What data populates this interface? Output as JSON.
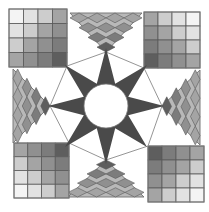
{
  "colors": {
    "background": "#ffffff",
    "star": "#4a4a4a",
    "center": "#ffffff",
    "outline": "#7a7a7a",
    "grid_line": "#5a5a5a",
    "shades": [
      "#f4f4f4",
      "#e2e2e2",
      "#cdcdcd",
      "#b8b8b8",
      "#a4a4a4",
      "#909090",
      "#7c7c7c",
      "#5e5e5e"
    ]
  },
  "corner_squares": [
    {
      "name": "top-left",
      "x": 9,
      "y": 9,
      "size": 58,
      "dark_corner": "bottom-right"
    },
    {
      "name": "top-right",
      "x": 144,
      "y": 12,
      "size": 56,
      "dark_corner": "bottom-left"
    },
    {
      "name": "bottom-left",
      "x": 14,
      "y": 143,
      "size": 55,
      "dark_corner": "top-right"
    },
    {
      "name": "bottom-right",
      "x": 148,
      "y": 146,
      "size": 56,
      "dark_corner": "top-left"
    }
  ],
  "edge_triangles": [
    {
      "name": "top",
      "base": [
        [
          70,
          13
        ],
        [
          142,
          13
        ]
      ],
      "apex": [
        106,
        52
      ]
    },
    {
      "name": "bottom",
      "base": [
        [
          68,
          197
        ],
        [
          144,
          197
        ]
      ],
      "apex": [
        106,
        160
      ]
    },
    {
      "name": "left",
      "base": [
        [
          13,
          69
        ],
        [
          13,
          143
        ]
      ],
      "apex": [
        50,
        106
      ]
    },
    {
      "name": "right",
      "base": [
        [
          200,
          70
        ],
        [
          200,
          145
        ]
      ],
      "apex": [
        162,
        106
      ]
    }
  ],
  "star": {
    "cx": 106,
    "cy": 106,
    "outer": 58,
    "inner": 24,
    "points": 8,
    "circle_r": 22
  }
}
